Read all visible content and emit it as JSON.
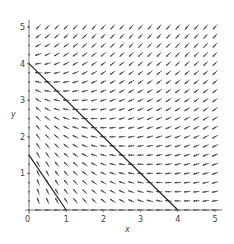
{
  "chart_data": {
    "type": "vector_field",
    "title": "",
    "xlabel": "x",
    "ylabel": "y",
    "xlim": [
      0,
      5
    ],
    "ylim": [
      0,
      5
    ],
    "xticks": [
      "0",
      "1",
      "2",
      "3",
      "4",
      "5"
    ],
    "yticks": [
      "1",
      "2",
      "3",
      "4",
      "5"
    ],
    "grid": false,
    "field": {
      "spacing": 0.25,
      "x_range": [
        0,
        5
      ],
      "y_range": [
        0,
        5
      ],
      "description": "Direction field; arrows point leftward in most of the plane, upward near the y-axis below y=4 and downward above y=4"
    },
    "lines": [
      {
        "name": "line-upper",
        "points": [
          [
            0,
            4
          ],
          [
            4,
            0
          ]
        ]
      },
      {
        "name": "line-lower",
        "points": [
          [
            0,
            1.5
          ],
          [
            1,
            0
          ]
        ]
      }
    ]
  },
  "colors": {
    "arrow": "#444444",
    "line": "#222222",
    "axis": "#777777"
  }
}
